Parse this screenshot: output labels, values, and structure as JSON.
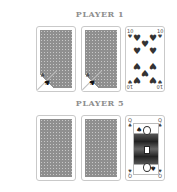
{
  "players": [
    {
      "label": "PLAYER 1",
      "cards": [
        {
          "state": "face-down",
          "corner_peek": true,
          "peek_rank": "A",
          "peek_suit": "♠"
        },
        {
          "state": "face-down",
          "corner_peek": true,
          "peek_rank": "A",
          "peek_suit": "♠"
        },
        {
          "state": "face-up",
          "rank": "10",
          "suit": "♥",
          "suit_name": "hearts"
        }
      ]
    },
    {
      "label": "PLAYER 5",
      "cards": [
        {
          "state": "face-down"
        },
        {
          "state": "face-down"
        },
        {
          "state": "face-up",
          "rank": "Q",
          "suit": "♠",
          "suit_name": "spades"
        }
      ]
    }
  ],
  "colors": {
    "label": "#8e8e8e",
    "card_back": "#8f8f8f",
    "card_border": "#c9c9c9",
    "pip": "#333333"
  }
}
